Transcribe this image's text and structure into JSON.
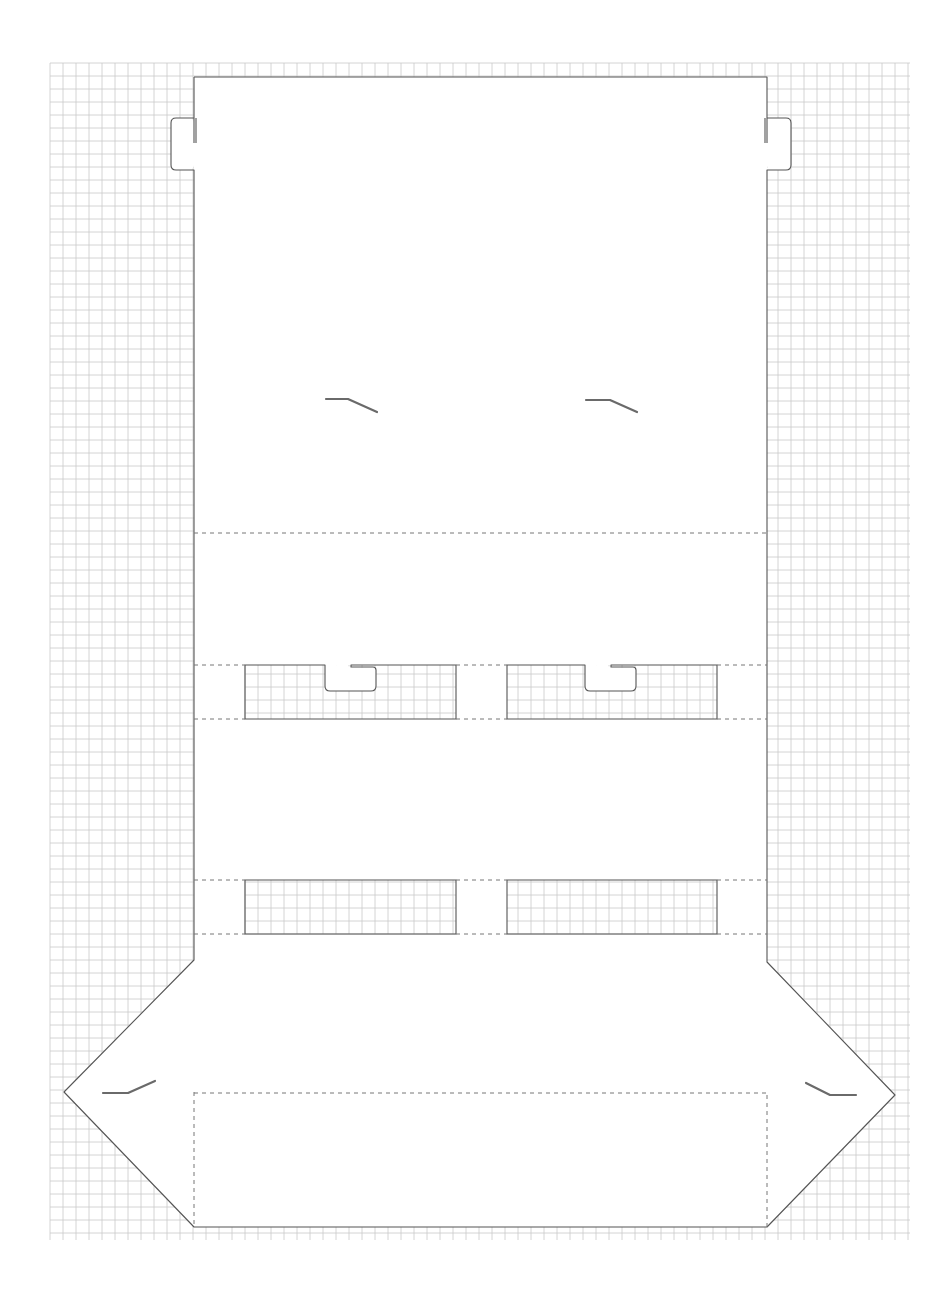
{
  "diagram": {
    "type": "die-cut packaging template (dieline) on grid paper",
    "colors": {
      "background": "#ffffff",
      "grid": "#c9c9c9",
      "cut_line": "#555555",
      "fold_line": "#777777",
      "slot": "#6a6a6a"
    },
    "grid": {
      "x0": 50,
      "y0": 63,
      "x1": 910,
      "y1": 1240,
      "step": 13
    },
    "main_panel": {
      "left": 194,
      "right": 767,
      "top": 77,
      "bottom": 1227
    },
    "top_tabs": [
      {
        "side": "left",
        "slit_x": 194,
        "top": 118,
        "slit_bottom": 143,
        "bottom": 170,
        "outer_x": 171
      },
      {
        "side": "right",
        "slit_x": 767,
        "top": 118,
        "slit_bottom": 143,
        "bottom": 170,
        "outer_x": 791
      }
    ],
    "side_flaps": [
      {
        "side": "left",
        "top": [
          194,
          960
        ],
        "tip": [
          64,
          1092
        ],
        "bottom": [
          194,
          1227
        ]
      },
      {
        "side": "right",
        "top": [
          767,
          962
        ],
        "tip": [
          895,
          1095
        ],
        "bottom": [
          767,
          1227
        ]
      }
    ],
    "fold_lines": [
      {
        "y": 533,
        "x1": 194,
        "x2": 767
      },
      {
        "y": 1093,
        "x1": 194,
        "x2": 767
      }
    ],
    "window_rows": [
      {
        "top": 665,
        "bottom": 719,
        "windows": [
          {
            "left": 245,
            "right": 456,
            "notch": {
              "left": 325,
              "right": 376,
              "bottom": 691,
              "slit_left": 351
            }
          },
          {
            "left": 507,
            "right": 717,
            "notch": {
              "left": 585,
              "right": 636,
              "bottom": 691,
              "slit_left": 611
            }
          }
        ]
      },
      {
        "top": 880,
        "bottom": 934,
        "windows": [
          {
            "left": 245,
            "right": 456
          },
          {
            "left": 507,
            "right": 717
          }
        ]
      }
    ],
    "slots": [
      {
        "points": [
          [
            326,
            399
          ],
          [
            348,
            399
          ],
          [
            377,
            412
          ]
        ]
      },
      {
        "points": [
          [
            586,
            400
          ],
          [
            610,
            400
          ],
          [
            637,
            412
          ]
        ]
      },
      {
        "points": [
          [
            103,
            1093
          ],
          [
            128,
            1093
          ],
          [
            155,
            1081
          ]
        ]
      },
      {
        "points": [
          [
            806,
            1083
          ],
          [
            830,
            1095
          ],
          [
            856,
            1095
          ]
        ]
      }
    ]
  }
}
